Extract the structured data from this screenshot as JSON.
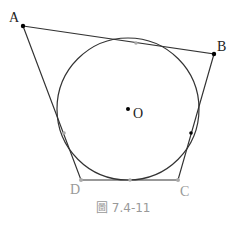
{
  "figure": {
    "caption": "圖 7.4-11",
    "colors": {
      "line": "#333333",
      "gray": "#999999",
      "black": "#000000"
    },
    "points": {
      "A": {
        "label": "A",
        "x": 23,
        "y": 26
      },
      "B": {
        "label": "B",
        "x": 214,
        "y": 54
      },
      "C": {
        "label": "C",
        "x": 178,
        "y": 180
      },
      "D": {
        "label": "D",
        "x": 81,
        "y": 180
      },
      "O": {
        "label": "O",
        "x": 128,
        "y": 109
      }
    },
    "circle": {
      "center": "O",
      "radius": 71
    },
    "tangent_points": [
      {
        "x": 136,
        "y": 43
      },
      {
        "x": 130,
        "y": 180
      },
      {
        "x": 64,
        "y": 133
      },
      {
        "x": 191,
        "y": 133
      }
    ]
  }
}
